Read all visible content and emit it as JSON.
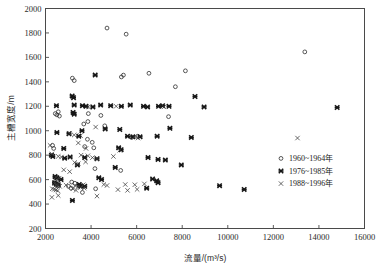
{
  "chart": {
    "type": "scatter",
    "title": "",
    "xlabel": "流量/(m³/s)",
    "ylabel": "主槽宽度/m",
    "xlim": [
      2000,
      16000
    ],
    "ylim": [
      200,
      2000
    ],
    "xticks": [
      2000,
      4000,
      6000,
      8000,
      10000,
      12000,
      14000,
      16000
    ],
    "yticks": [
      200,
      400,
      600,
      800,
      1000,
      1200,
      1400,
      1600,
      1800,
      2000
    ],
    "xtick_labels": [
      "2000",
      "4000",
      "6000",
      "8000",
      "10000",
      "12000",
      "14000",
      "16000"
    ],
    "ytick_labels": [
      "200",
      "400",
      "600",
      "800",
      "1000",
      "1200",
      "1400",
      "1600",
      "1800",
      "2000"
    ],
    "grid": false,
    "legend_position": "center-right",
    "legend": [
      {
        "label": "1960~1964年",
        "marker": "open-circle"
      },
      {
        "label": "1976~1985年",
        "marker": "bold-cross"
      },
      {
        "label": "1988~1996年",
        "marker": "thin-cross"
      }
    ]
  },
  "chart_data": {
    "type": "scatter",
    "title": "",
    "xlabel": "流量/(m³/s)",
    "ylabel": "主槽宽度/m",
    "xlim": [
      2000,
      16000
    ],
    "ylim": [
      200,
      2000
    ],
    "xticks": [
      2000,
      4000,
      6000,
      8000,
      10000,
      12000,
      14000,
      16000
    ],
    "yticks": [
      200,
      400,
      600,
      800,
      1000,
      1200,
      1400,
      1600,
      1800,
      2000
    ],
    "grid": false,
    "legend_position": "center-right",
    "series": [
      {
        "name": "1960~1964年",
        "marker": "open-circle",
        "color": "#2f2f2f",
        "points": [
          [
            4700,
            1840
          ],
          [
            5540,
            1790
          ],
          [
            13380,
            1645
          ],
          [
            3180,
            1430
          ],
          [
            3260,
            1410
          ],
          [
            5330,
            1440
          ],
          [
            6540,
            1470
          ],
          [
            8140,
            1490
          ],
          [
            7700,
            1360
          ],
          [
            5420,
            1455
          ],
          [
            2430,
            1140
          ],
          [
            2500,
            1130
          ],
          [
            2560,
            1155
          ],
          [
            2610,
            1120
          ],
          [
            3880,
            1140
          ],
          [
            4430,
            1125
          ],
          [
            7400,
            1115
          ],
          [
            3680,
            1055
          ],
          [
            3860,
            1075
          ],
          [
            4600,
            1040
          ],
          [
            3840,
            930
          ],
          [
            4050,
            905
          ],
          [
            5780,
            945
          ],
          [
            6050,
            955
          ],
          [
            3720,
            870
          ],
          [
            4120,
            860
          ],
          [
            2310,
            880
          ],
          [
            2360,
            855
          ],
          [
            4170,
            690
          ],
          [
            5300,
            675
          ],
          [
            2420,
            620
          ],
          [
            2560,
            610
          ],
          [
            3150,
            580
          ],
          [
            3290,
            570
          ],
          [
            3010,
            545
          ],
          [
            3120,
            530
          ],
          [
            4200,
            525
          ],
          [
            3620,
            495
          ],
          [
            2390,
            575
          ],
          [
            2480,
            560
          ],
          [
            2550,
            548
          ]
        ]
      },
      {
        "name": "1976~1985年",
        "marker": "bold-cross",
        "color": "#161616",
        "points": [
          [
            14800,
            1190
          ],
          [
            3170,
            1285
          ],
          [
            3230,
            1270
          ],
          [
            8560,
            1280
          ],
          [
            4180,
            1455
          ],
          [
            2480,
            1205
          ],
          [
            3260,
            1210
          ],
          [
            3620,
            1205
          ],
          [
            3780,
            1200
          ],
          [
            4080,
            1195
          ],
          [
            4420,
            1210
          ],
          [
            4860,
            1205
          ],
          [
            5330,
            1200
          ],
          [
            5720,
            1210
          ],
          [
            6300,
            1200
          ],
          [
            6480,
            1195
          ],
          [
            6960,
            1200
          ],
          [
            7140,
            1205
          ],
          [
            7420,
            1200
          ],
          [
            8960,
            1195
          ],
          [
            3210,
            1150
          ],
          [
            3260,
            1135
          ],
          [
            3600,
            1000
          ],
          [
            4620,
            1015
          ],
          [
            5260,
            1010
          ],
          [
            7460,
            1020
          ],
          [
            2500,
            985
          ],
          [
            3030,
            975
          ],
          [
            3460,
            955
          ],
          [
            5600,
            955
          ],
          [
            5830,
            950
          ],
          [
            6150,
            950
          ],
          [
            6900,
            955
          ],
          [
            8400,
            945
          ],
          [
            2800,
            855
          ],
          [
            5210,
            860
          ],
          [
            5320,
            845
          ],
          [
            2260,
            800
          ],
          [
            2320,
            790
          ],
          [
            2840,
            775
          ],
          [
            3080,
            785
          ],
          [
            3720,
            780
          ],
          [
            4260,
            770
          ],
          [
            3400,
            720
          ],
          [
            5060,
            700
          ],
          [
            6500,
            780
          ],
          [
            6940,
            765
          ],
          [
            7260,
            760
          ],
          [
            7960,
            720
          ],
          [
            2420,
            625
          ],
          [
            2500,
            615
          ],
          [
            2680,
            600
          ],
          [
            4340,
            615
          ],
          [
            4460,
            600
          ],
          [
            2400,
            575
          ],
          [
            2470,
            565
          ],
          [
            2560,
            558
          ],
          [
            3480,
            560
          ],
          [
            3540,
            548
          ],
          [
            3720,
            545
          ],
          [
            6700,
            605
          ],
          [
            6880,
            590
          ],
          [
            6940,
            575
          ],
          [
            6440,
            530
          ],
          [
            9640,
            550
          ],
          [
            10720,
            520
          ],
          [
            3180,
            430
          ]
        ]
      },
      {
        "name": "1988~1996年",
        "marker": "thin-cross",
        "color": "#3a3a3a",
        "points": [
          [
            3880,
            1195
          ],
          [
            5100,
            1200
          ],
          [
            7200,
            1195
          ],
          [
            3060,
            980
          ],
          [
            3260,
            965
          ],
          [
            3540,
            960
          ],
          [
            4200,
            1030
          ],
          [
            5900,
            950
          ],
          [
            6060,
            940
          ],
          [
            13060,
            940
          ],
          [
            3440,
            900
          ],
          [
            3780,
            855
          ],
          [
            5260,
            840
          ],
          [
            2200,
            880
          ],
          [
            2280,
            810
          ],
          [
            2560,
            790
          ],
          [
            2700,
            785
          ],
          [
            3560,
            800
          ],
          [
            3860,
            795
          ],
          [
            4060,
            780
          ],
          [
            4260,
            770
          ],
          [
            3280,
            740
          ],
          [
            3440,
            730
          ],
          [
            3760,
            745
          ],
          [
            4980,
            790
          ],
          [
            2800,
            680
          ],
          [
            3060,
            665
          ],
          [
            2460,
            620
          ],
          [
            2600,
            612
          ],
          [
            2400,
            568
          ],
          [
            2470,
            560
          ],
          [
            2540,
            552
          ],
          [
            2620,
            545
          ],
          [
            2900,
            555
          ],
          [
            3300,
            550
          ],
          [
            3420,
            540
          ],
          [
            3540,
            535
          ],
          [
            3660,
            558
          ],
          [
            4560,
            560
          ],
          [
            4700,
            552
          ],
          [
            5500,
            560
          ],
          [
            5920,
            558
          ],
          [
            6340,
            565
          ],
          [
            2300,
            525
          ],
          [
            2380,
            520
          ],
          [
            2460,
            515
          ],
          [
            2540,
            510
          ],
          [
            3200,
            525
          ],
          [
            3340,
            512
          ],
          [
            3700,
            530
          ],
          [
            5180,
            518
          ],
          [
            5600,
            512
          ],
          [
            6020,
            520
          ],
          [
            2280,
            455
          ],
          [
            2560,
            470
          ],
          [
            4260,
            465
          ]
        ]
      }
    ]
  }
}
